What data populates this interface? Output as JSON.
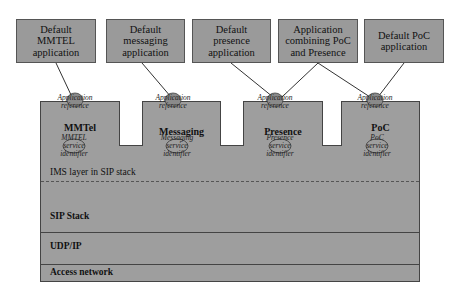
{
  "applications": [
    {
      "id": "mmtel-app",
      "label": "Default\nMMTEL\napplication"
    },
    {
      "id": "messaging-app",
      "label": "Default\nmessaging\napplication"
    },
    {
      "id": "presence-app",
      "label": "Default\npresence\napplication"
    },
    {
      "id": "poc-presence-app",
      "label": "Application\ncombining PoC\nand Presence"
    },
    {
      "id": "poc-app",
      "label": "Default PoC\napplication"
    }
  ],
  "services": [
    {
      "name": "MMTel",
      "service_id": "MMTEL"
    },
    {
      "name": "Messaging",
      "service_id": "Messaging"
    },
    {
      "name": "Presence",
      "service_id": "Presence"
    },
    {
      "name": "PoC",
      "service_id": "PoC"
    }
  ],
  "labels": {
    "app_ref_1": "Application",
    "app_ref_2": "reference",
    "svc_id_1": "service",
    "svc_id_2": "identifier"
  },
  "layers": {
    "ims": "IMS layer in SIP stack",
    "sip": "SIP Stack",
    "udp": "UDP/IP",
    "access": "Access network"
  },
  "colors": {
    "box_fill": "#9a9a9a",
    "border": "#444444",
    "background": "#ffffff"
  }
}
